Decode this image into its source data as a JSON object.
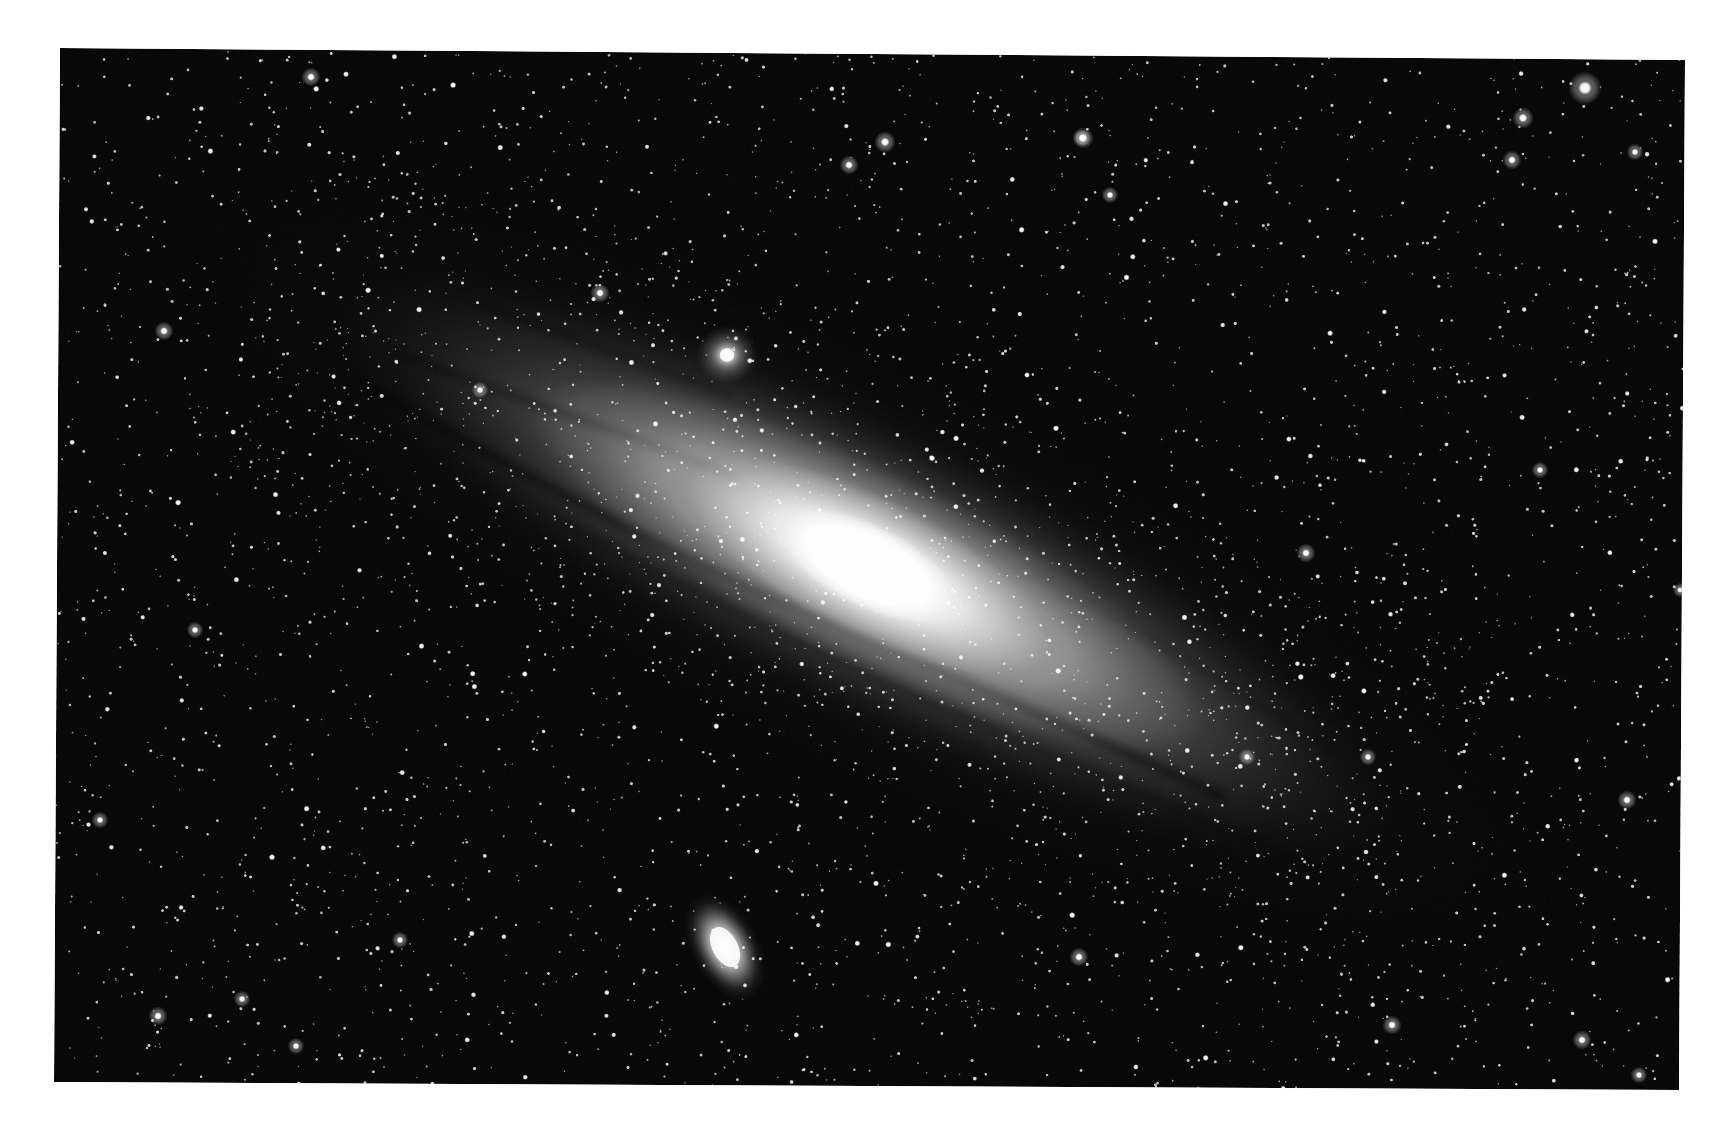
{
  "image": {
    "subject": "Andromeda Galaxy",
    "width": 1727,
    "height": 1135,
    "page_background": "#ffffff",
    "sky_color": "#040404",
    "frame": {
      "corners": {
        "top_left": [
          60,
          48
        ],
        "top_right": [
          1685,
          60
        ],
        "bottom_right": [
          1679,
          1090
        ],
        "bottom_left": [
          54,
          1082
        ]
      }
    }
  },
  "galaxy": {
    "center": [
      868,
      566
    ],
    "angle_deg": 26.5,
    "outer_halo": {
      "rx": 760,
      "ry": 210,
      "color": "#9a9a9a",
      "opacity": 0.32
    },
    "disk": {
      "rx": 620,
      "ry": 150,
      "color": "#b8b8b8",
      "opacity": 0.55
    },
    "inner_disk": {
      "rx": 380,
      "ry": 100,
      "color": "#d8d8d8",
      "opacity": 0.75
    },
    "bulge": {
      "rx": 200,
      "ry": 70,
      "color": "#f2f2f2",
      "opacity": 0.95
    },
    "core": {
      "rx": 95,
      "ry": 42,
      "color": "#ffffff",
      "opacity": 1
    },
    "dust_lanes": [
      {
        "d": "M -560 62 C -380 70, -200 78, -60 70 S 200 56, 420 48",
        "width": 9,
        "opacity": 0.55
      },
      {
        "d": "M -520 20 C -400 10, -300 -10, -160 -20",
        "width": 7,
        "opacity": 0.45
      },
      {
        "d": "M -470 -60 C -380 -70, -300 -80, -200 -92",
        "width": 6,
        "opacity": 0.4
      },
      {
        "d": "M -300 96 C -160 104, 0 100, 160 92 S 380 80, 520 70",
        "width": 6,
        "opacity": 0.35
      },
      {
        "d": "M 150 -70 C 260 -60, 380 -58, 500 -40",
        "width": 5,
        "opacity": 0.3
      }
    ]
  },
  "satellites": [
    {
      "name": "M32",
      "center": [
        727,
        355
      ],
      "rx": 16,
      "ry": 15,
      "glow": 32,
      "angle_deg": 0
    },
    {
      "name": "M110",
      "center": [
        725,
        947
      ],
      "rx": 28,
      "ry": 48,
      "glow": 60,
      "angle_deg": -28
    }
  ],
  "bright_stars": [
    {
      "x": 1585,
      "y": 88,
      "r": 7
    },
    {
      "x": 727,
      "y": 355,
      "r": 0
    },
    {
      "x": 885,
      "y": 142,
      "r": 4.5
    },
    {
      "x": 1083,
      "y": 138,
      "r": 4.5
    },
    {
      "x": 849,
      "y": 165,
      "r": 4
    },
    {
      "x": 1523,
      "y": 118,
      "r": 4.5
    },
    {
      "x": 1512,
      "y": 160,
      "r": 4
    },
    {
      "x": 311,
      "y": 77,
      "r": 4
    },
    {
      "x": 164,
      "y": 331,
      "r": 4
    },
    {
      "x": 600,
      "y": 293,
      "r": 4
    },
    {
      "x": 1082,
      "y": 138,
      "r": 3.5
    },
    {
      "x": 1635,
      "y": 152,
      "r": 3.5
    },
    {
      "x": 1306,
      "y": 553,
      "r": 4
    },
    {
      "x": 1627,
      "y": 800,
      "r": 4
    },
    {
      "x": 1582,
      "y": 1040,
      "r": 4
    },
    {
      "x": 1079,
      "y": 957,
      "r": 4
    },
    {
      "x": 1639,
      "y": 1075,
      "r": 3.5
    },
    {
      "x": 158,
      "y": 1016,
      "r": 4
    },
    {
      "x": 296,
      "y": 1046,
      "r": 3.5
    },
    {
      "x": 242,
      "y": 999,
      "r": 3.5
    },
    {
      "x": 1392,
      "y": 1025,
      "r": 4
    },
    {
      "x": 195,
      "y": 630,
      "r": 3.5
    },
    {
      "x": 480,
      "y": 390,
      "r": 3.5
    },
    {
      "x": 1247,
      "y": 757,
      "r": 3.5
    },
    {
      "x": 1368,
      "y": 757,
      "r": 3.5
    },
    {
      "x": 1540,
      "y": 470,
      "r": 3.5
    },
    {
      "x": 1680,
      "y": 590,
      "r": 3
    },
    {
      "x": 100,
      "y": 820,
      "r": 3.5
    },
    {
      "x": 400,
      "y": 940,
      "r": 3.5
    },
    {
      "x": 1110,
      "y": 195,
      "r": 3.5
    }
  ],
  "starfield": {
    "seed": 31415,
    "count": 3600,
    "galaxy_extra": 900,
    "min_r": 0.7,
    "max_r": 3.2,
    "bright_fraction": 0.06,
    "color": "#ffffff"
  }
}
